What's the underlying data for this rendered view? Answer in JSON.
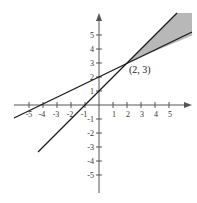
{
  "figure": {
    "type": "graph-of-linear-inequalities",
    "x_axis": {
      "ticks": [
        -5,
        -4,
        -3,
        -2,
        -1,
        1,
        2,
        3,
        4,
        5
      ],
      "range": [
        -6,
        6
      ]
    },
    "y_axis": {
      "ticks": [
        -5,
        -4,
        -3,
        -2,
        -1,
        1,
        2,
        3,
        4,
        5
      ],
      "range": [
        -6,
        6
      ]
    },
    "lines": [
      {
        "name": "line-1",
        "equation": "y = x/2 + 2",
        "slope": 0.5,
        "intercept": 2,
        "x_from": -6.5,
        "x_to": 6.2
      },
      {
        "name": "line-2",
        "equation": "y = x + 1",
        "slope": 1,
        "intercept": 1,
        "x_from": -4.4,
        "x_to": 5.4
      }
    ],
    "intersection": {
      "x": 2,
      "y": 3,
      "label": "(2, 3)"
    },
    "shaded_region": {
      "description": "region between the two lines for x > 2",
      "color": "#b8b8b8"
    },
    "colors": {
      "axis": "#555555",
      "line": "#1a1a1a",
      "shade": "#b8b8b8"
    }
  },
  "labels": {
    "x_ticks": [
      "-5",
      "-4",
      "-3",
      "-2",
      "-1",
      "1",
      "2",
      "3",
      "4",
      "5"
    ],
    "y_ticks": [
      "5",
      "4",
      "3",
      "2",
      "1",
      "-1",
      "-2",
      "-3",
      "-4",
      "-5"
    ],
    "point": "(2, 3)"
  }
}
